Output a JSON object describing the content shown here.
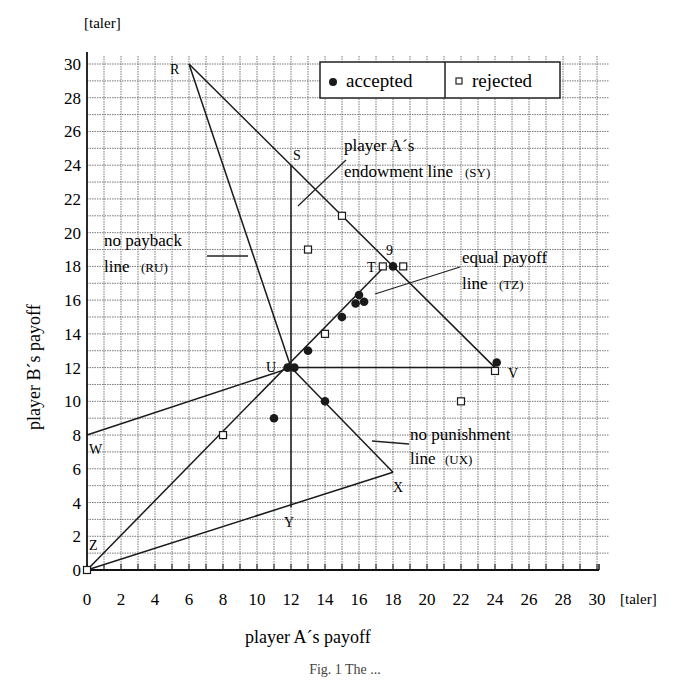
{
  "chart_data": {
    "type": "scatter",
    "title": "",
    "xlabel": "player A´s payoff",
    "ylabel": "player B´s payoff",
    "x_unit": "[taler]",
    "y_unit": "[taler]",
    "xlim": [
      0,
      30
    ],
    "ylim": [
      0,
      30
    ],
    "x_ticks": [
      0,
      2,
      4,
      6,
      8,
      10,
      12,
      14,
      16,
      18,
      20,
      22,
      24,
      26,
      28,
      30
    ],
    "y_ticks": [
      0,
      2,
      4,
      6,
      8,
      10,
      12,
      14,
      16,
      18,
      20,
      22,
      24,
      26,
      28,
      30
    ],
    "grid": true,
    "legend_position": "top-right",
    "legend": [
      {
        "label": "accepted",
        "marker": "filled-circle"
      },
      {
        "label": "rejected",
        "marker": "open-square"
      }
    ],
    "points_labeled": {
      "R": [
        6,
        30
      ],
      "S": [
        12,
        24
      ],
      "T": [
        17.5,
        18
      ],
      "U": [
        12,
        12
      ],
      "V": [
        24,
        12
      ],
      "W": [
        0,
        8
      ],
      "X": [
        18,
        5.8
      ],
      "Y": [
        12,
        3.7
      ],
      "Z": [
        0,
        0
      ]
    },
    "lines": [
      {
        "name": "RV",
        "from": "R",
        "to": "V"
      },
      {
        "name": "no payback line (RU)",
        "from": "R",
        "to": "U"
      },
      {
        "name": "player A´s endowment line (SY)",
        "from": "S",
        "to": "Y"
      },
      {
        "name": "UV",
        "from": "U",
        "to": "V"
      },
      {
        "name": "equal payoff line (TZ)",
        "from": "T",
        "to": "Z"
      },
      {
        "name": "WU",
        "from": "W",
        "to": "U"
      },
      {
        "name": "no punishment line (UX)",
        "from": "U",
        "to": "X"
      },
      {
        "name": "ZX",
        "from": "Z",
        "to": "X"
      }
    ],
    "series": [
      {
        "name": "accepted",
        "marker": "filled-circle",
        "points": [
          [
            11,
            9
          ],
          [
            11.8,
            12
          ],
          [
            12.2,
            12
          ],
          [
            13,
            13
          ],
          [
            14,
            10
          ],
          [
            15,
            15
          ],
          [
            15.8,
            15.8
          ],
          [
            16,
            16.3
          ],
          [
            16.3,
            15.9
          ],
          [
            18,
            18
          ],
          [
            24.1,
            12.3
          ]
        ]
      },
      {
        "name": "rejected",
        "marker": "open-square",
        "points": [
          [
            0,
            0
          ],
          [
            8,
            8
          ],
          [
            13,
            19
          ],
          [
            14,
            14
          ],
          [
            15,
            21
          ],
          [
            17.4,
            18
          ],
          [
            18.6,
            18
          ],
          [
            22,
            10
          ],
          [
            24,
            11.8
          ]
        ]
      }
    ],
    "annotations": [
      {
        "text": "player A´s",
        "text2": "endowment line",
        "tag": "(SY)"
      },
      {
        "text": "no payback",
        "text2": "line",
        "tag": "(RU)"
      },
      {
        "text": "equal payoff",
        "text2": "line",
        "tag": "(TZ)"
      },
      {
        "text": "no punishment",
        "text2": "line",
        "tag": "(UX)"
      },
      {
        "text": "9"
      }
    ]
  },
  "labels": {
    "y_unit": "[taler]",
    "x_unit": "[taler]",
    "x_title": "player A´s payoff",
    "y_title": "player B´s payoff",
    "legend_accepted": "accepted",
    "legend_rejected": "rejected",
    "ann_endowment_1": "player A´s",
    "ann_endowment_2": "endowment line",
    "ann_endowment_tag": "(SY)",
    "ann_payback_1": "no payback",
    "ann_payback_2": "line",
    "ann_payback_tag": "(RU)",
    "ann_equal_1": "equal payoff",
    "ann_equal_2": "line",
    "ann_equal_tag": "(TZ)",
    "ann_punish_1": "no punishment",
    "ann_punish_2": "line",
    "ann_punish_tag": "(UX)",
    "ann_nine": "9",
    "pt_R": "R",
    "pt_S": "S",
    "pt_T": "T",
    "pt_U": "U",
    "pt_V": "V",
    "pt_W": "W",
    "pt_X": "X",
    "pt_Y": "Y",
    "pt_Z": "Z",
    "caption": "Fig. 1 The ..."
  }
}
